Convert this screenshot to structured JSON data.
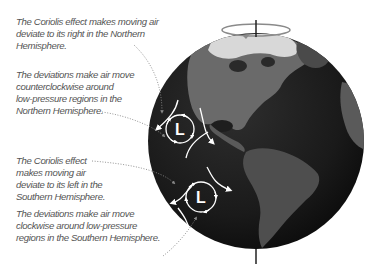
{
  "figure": {
    "type": "diagram",
    "colors": {
      "background": "#ffffff",
      "caption_text": "#555555",
      "globe_ocean": "#1c1c1c",
      "land": "#6a6a6a",
      "ice": "#dcdcdc",
      "arrows": "#ffffff",
      "axis": "#222222",
      "rotation_ellipse": "#8a8a8a",
      "leader_lines": "#888888"
    }
  },
  "captions": [
    {
      "id": "north-coriolis",
      "lines": [
        "The Coriolis effect makes moving air",
        "deviate to its right in the Northern",
        "Hemisphere."
      ]
    },
    {
      "id": "north-deviation",
      "lines": [
        "The deviations make air move",
        "counterclockwise around",
        "low-pressure regions in the",
        "Northern Hemisphere."
      ]
    },
    {
      "id": "south-coriolis",
      "lines": [
        "The Coriolis effect",
        "makes moving air",
        "deviate to its left in the",
        "Southern Hemisphere."
      ]
    },
    {
      "id": "south-deviation",
      "lines": [
        "The deviations make air move",
        "clockwise around low-pressure",
        "regions in the Southern Hemisphere."
      ]
    }
  ],
  "globe": {
    "label_north_low": "L",
    "label_south_low": "L",
    "north_rotation": "counterclockwise",
    "south_rotation": "clockwise",
    "icons": [
      "rotation-axis-icon",
      "rotation-direction-icon",
      "low-pressure-icon"
    ]
  }
}
